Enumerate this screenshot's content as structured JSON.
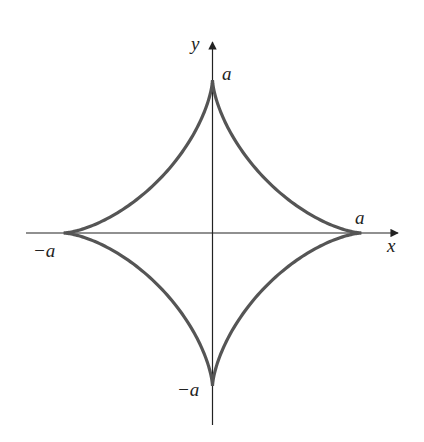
{
  "figure": {
    "curve_color": "#555555",
    "axis_color": "#222222"
  },
  "axes": {
    "x_label": "x",
    "y_label": "y"
  },
  "labels": {
    "top": "a",
    "right": "a",
    "left": "−a",
    "bottom": "−a"
  }
}
